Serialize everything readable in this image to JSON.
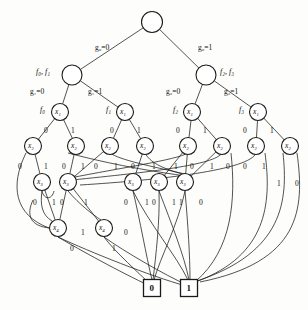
{
  "diagram": {
    "type": "bdd-multi-rooted-dag",
    "stroke_color": "#1a1a1a",
    "node_fill": "#ffffff",
    "background": "#fdfdfb"
  },
  "nodes": {
    "root": {
      "id": "root",
      "label": "",
      "x": 152,
      "y": 22,
      "r": 10.5
    },
    "level_g1": [
      {
        "id": "g1n",
        "label": "",
        "x": 72,
        "y": 75,
        "r": 10
      },
      {
        "id": "g2n",
        "label": "",
        "x": 206,
        "y": 75,
        "r": 10
      }
    ],
    "level_x1": [
      {
        "id": "x1a",
        "label": "x₁",
        "x": 60,
        "y": 112,
        "r": 8.5
      },
      {
        "id": "x1b",
        "label": "x₁",
        "x": 125,
        "y": 112,
        "r": 8.5
      },
      {
        "id": "x1c",
        "label": "x₁",
        "x": 192,
        "y": 112,
        "r": 8.5
      },
      {
        "id": "x1d",
        "label": "x₁",
        "x": 258,
        "y": 112,
        "r": 8.5
      }
    ],
    "level_x2": [
      {
        "id": "x2a",
        "label": "x₂",
        "x": 33,
        "y": 146,
        "r": 8.5
      },
      {
        "id": "x2b",
        "label": "x₂",
        "x": 76,
        "y": 146,
        "r": 8.5
      },
      {
        "id": "x2c",
        "label": "x₂",
        "x": 110,
        "y": 146,
        "r": 8.5
      },
      {
        "id": "x2d",
        "label": "x₂",
        "x": 145,
        "y": 146,
        "r": 8.5
      },
      {
        "id": "x2e",
        "label": "x₂",
        "x": 188,
        "y": 146,
        "r": 8.5
      },
      {
        "id": "x2f",
        "label": "x₂",
        "x": 222,
        "y": 146,
        "r": 8.5
      },
      {
        "id": "x2g",
        "label": "x₂",
        "x": 256,
        "y": 146,
        "r": 8.5
      },
      {
        "id": "x2h",
        "label": "x₂",
        "x": 290,
        "y": 146,
        "r": 8.5
      }
    ],
    "level_x3": [
      {
        "id": "x3a",
        "label": "x₃",
        "x": 42,
        "y": 182,
        "r": 8.5
      },
      {
        "id": "x3b",
        "label": "x₃",
        "x": 68,
        "y": 182,
        "r": 8.5
      },
      {
        "id": "x3c",
        "label": "x₃",
        "x": 133,
        "y": 182,
        "r": 8.5
      },
      {
        "id": "x3d",
        "label": "x₃",
        "x": 159,
        "y": 182,
        "r": 8.5
      },
      {
        "id": "x3e",
        "label": "x₃",
        "x": 185,
        "y": 182,
        "r": 8.5
      }
    ],
    "level_x4": [
      {
        "id": "x4a",
        "label": "x₄",
        "x": 58,
        "y": 228,
        "r": 8.5
      },
      {
        "id": "x4b",
        "label": "x₄",
        "x": 104,
        "y": 228,
        "r": 8.5
      }
    ],
    "terminals": [
      {
        "id": "t0",
        "label": "0",
        "x": 152,
        "y": 288,
        "w": 17,
        "h": 17
      },
      {
        "id": "t1",
        "label": "1",
        "x": 189,
        "y": 288,
        "w": 17,
        "h": 17
      }
    ]
  },
  "function_labels": [
    {
      "text": "f₀, f₁",
      "x": 36,
      "y": 68
    },
    {
      "text": "f₂, f₃",
      "x": 220,
      "y": 68
    },
    {
      "text": "f₀",
      "x": 40,
      "y": 106
    },
    {
      "text": "f₁",
      "x": 106,
      "y": 106
    },
    {
      "text": "f₂",
      "x": 173,
      "y": 106
    },
    {
      "text": "f₃",
      "x": 239,
      "y": 106
    }
  ],
  "decision_edge_labels": [
    {
      "text": "g₀=0",
      "x": 95,
      "y": 44
    },
    {
      "text": "g₀=1",
      "x": 198,
      "y": 44
    },
    {
      "text": "g₁=0",
      "x": 30,
      "y": 88
    },
    {
      "text": "g₁=1",
      "x": 88,
      "y": 88
    },
    {
      "text": "g₂=0",
      "x": 166,
      "y": 88
    },
    {
      "text": "g₂=1",
      "x": 224,
      "y": 88
    }
  ],
  "binary_edge_labels": [
    {
      "text": "0",
      "x": 44,
      "y": 127
    },
    {
      "text": "1",
      "x": 71,
      "y": 127
    },
    {
      "text": "0",
      "x": 110,
      "y": 127
    },
    {
      "text": "1",
      "x": 137,
      "y": 127
    },
    {
      "text": "0",
      "x": 176,
      "y": 127
    },
    {
      "text": "1",
      "x": 203,
      "y": 127
    },
    {
      "text": "0",
      "x": 243,
      "y": 127
    },
    {
      "text": "1",
      "x": 270,
      "y": 127
    },
    {
      "text": "0",
      "x": 18,
      "y": 163
    },
    {
      "text": "1",
      "x": 44,
      "y": 163
    },
    {
      "text": "0",
      "x": 62,
      "y": 163
    },
    {
      "text": "1",
      "x": 81,
      "y": 163
    },
    {
      "text": "0",
      "x": 94,
      "y": 163
    },
    {
      "text": "1",
      "x": 114,
      "y": 163
    },
    {
      "text": "0",
      "x": 131,
      "y": 163
    },
    {
      "text": "1",
      "x": 152,
      "y": 163
    },
    {
      "text": "1",
      "x": 174,
      "y": 163
    },
    {
      "text": "0",
      "x": 190,
      "y": 163
    },
    {
      "text": "1",
      "x": 210,
      "y": 163
    },
    {
      "text": "0",
      "x": 226,
      "y": 163
    },
    {
      "text": "0",
      "x": 243,
      "y": 163
    },
    {
      "text": "1",
      "x": 262,
      "y": 163
    },
    {
      "text": "1",
      "x": 277,
      "y": 180
    },
    {
      "text": "0",
      "x": 295,
      "y": 180
    },
    {
      "text": "0",
      "x": 33,
      "y": 199
    },
    {
      "text": "1",
      "x": 52,
      "y": 199
    },
    {
      "text": "0",
      "x": 60,
      "y": 199
    },
    {
      "text": "1",
      "x": 84,
      "y": 199
    },
    {
      "text": "0",
      "x": 124,
      "y": 199
    },
    {
      "text": "1",
      "x": 145,
      "y": 199
    },
    {
      "text": "0",
      "x": 152,
      "y": 199
    },
    {
      "text": "1",
      "x": 172,
      "y": 199
    },
    {
      "text": "1",
      "x": 179,
      "y": 199
    },
    {
      "text": "0",
      "x": 199,
      "y": 199
    },
    {
      "text": "1",
      "x": 81,
      "y": 229
    },
    {
      "text": "0",
      "x": 124,
      "y": 229
    },
    {
      "text": "0",
      "x": 70,
      "y": 245
    },
    {
      "text": "1",
      "x": 112,
      "y": 245
    }
  ],
  "edges": {
    "straight": [
      {
        "from": "root",
        "to": "g1n"
      },
      {
        "from": "root",
        "to": "g2n"
      },
      {
        "from": "g1n",
        "to": "x1a"
      },
      {
        "from": "g1n",
        "to": "x1b"
      },
      {
        "from": "g2n",
        "to": "x1c"
      },
      {
        "from": "g2n",
        "to": "x1d"
      },
      {
        "from": "x1a",
        "to": "x2a"
      },
      {
        "from": "x1a",
        "to": "x2b"
      },
      {
        "from": "x1b",
        "to": "x2c"
      },
      {
        "from": "x1b",
        "to": "x2d"
      },
      {
        "from": "x1c",
        "to": "x2e"
      },
      {
        "from": "x1c",
        "to": "x2f"
      },
      {
        "from": "x1d",
        "to": "x2g"
      },
      {
        "from": "x1d",
        "to": "x2h"
      }
    ]
  }
}
